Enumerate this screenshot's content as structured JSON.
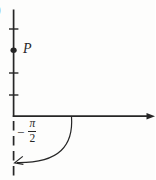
{
  "figure": {
    "background": "#fdfdfc",
    "ink_color": "#262626",
    "labels": {
      "corner_fragment": ")",
      "point": "P",
      "angle_minus": "−",
      "angle_numerator": "π",
      "angle_denominator": "2"
    }
  }
}
